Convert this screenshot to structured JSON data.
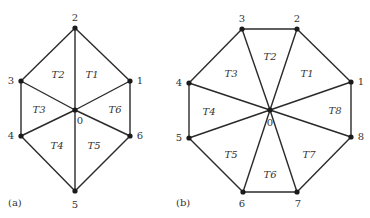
{
  "figures": [
    {
      "caption": "(a)",
      "caption_pos": [
        8,
        203
      ],
      "center": {
        "id": "0",
        "x": 75,
        "y": 110,
        "label_pos": [
          80,
          121
        ]
      },
      "vertices": [
        {
          "id": "1",
          "x": 130,
          "y": 81,
          "label_pos": [
            140,
            81
          ]
        },
        {
          "id": "2",
          "x": 75,
          "y": 28,
          "label_pos": [
            75,
            18
          ]
        },
        {
          "id": "3",
          "x": 21,
          "y": 81,
          "label_pos": [
            11,
            81
          ]
        },
        {
          "id": "4",
          "x": 21,
          "y": 136,
          "label_pos": [
            11,
            136
          ]
        },
        {
          "id": "5",
          "x": 75,
          "y": 191,
          "label_pos": [
            75,
            205
          ]
        },
        {
          "id": "6",
          "x": 130,
          "y": 136,
          "label_pos": [
            140,
            136
          ]
        }
      ],
      "triangles": [
        {
          "label": "T1",
          "x": 92,
          "y": 75
        },
        {
          "label": "T2",
          "x": 58,
          "y": 75
        },
        {
          "label": "T3",
          "x": 39,
          "y": 110
        },
        {
          "label": "T4",
          "x": 57,
          "y": 146
        },
        {
          "label": "T5",
          "x": 94,
          "y": 146
        },
        {
          "label": "T6",
          "x": 115,
          "y": 110
        }
      ]
    },
    {
      "caption": "(b)",
      "caption_pos": [
        176,
        203
      ],
      "center": {
        "id": "0",
        "x": 270,
        "y": 110,
        "label_pos": [
          270,
          123
        ]
      },
      "vertices": [
        {
          "id": "1",
          "x": 351,
          "y": 82,
          "label_pos": [
            361,
            82
          ]
        },
        {
          "id": "2",
          "x": 297,
          "y": 29,
          "label_pos": [
            297,
            19
          ]
        },
        {
          "id": "3",
          "x": 242,
          "y": 29,
          "label_pos": [
            242,
            19
          ]
        },
        {
          "id": "4",
          "x": 189,
          "y": 83,
          "label_pos": [
            179,
            83
          ]
        },
        {
          "id": "5",
          "x": 189,
          "y": 138,
          "label_pos": [
            179,
            138
          ]
        },
        {
          "id": "6",
          "x": 243,
          "y": 192,
          "label_pos": [
            242,
            204
          ]
        },
        {
          "id": "7",
          "x": 297,
          "y": 192,
          "label_pos": [
            298,
            204
          ]
        },
        {
          "id": "8",
          "x": 351,
          "y": 137,
          "label_pos": [
            361,
            137
          ]
        }
      ],
      "triangles": [
        {
          "label": "T1",
          "x": 307,
          "y": 74
        },
        {
          "label": "T2",
          "x": 270,
          "y": 57
        },
        {
          "label": "T3",
          "x": 231,
          "y": 74
        },
        {
          "label": "T4",
          "x": 209,
          "y": 112
        },
        {
          "label": "T5",
          "x": 231,
          "y": 155
        },
        {
          "label": "T6",
          "x": 270,
          "y": 175
        },
        {
          "label": "T7",
          "x": 309,
          "y": 155
        },
        {
          "label": "T8",
          "x": 335,
          "y": 111
        }
      ]
    }
  ]
}
